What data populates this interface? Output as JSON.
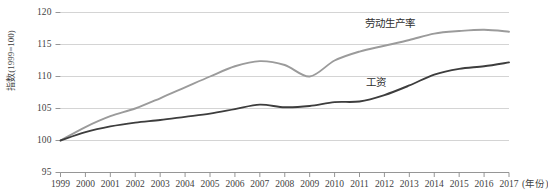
{
  "chart_data": {
    "type": "line",
    "title": "",
    "subtitle": "",
    "xlabel": "(年份)",
    "ylabel": "指数(1999=100)",
    "xlim": [
      1999,
      2017
    ],
    "ylim": [
      95,
      120
    ],
    "yticks": [
      95,
      100,
      105,
      110,
      115,
      120
    ],
    "grid": true,
    "grid_axis": "y",
    "legend_position": "inline-annotation",
    "x": [
      1999,
      2000,
      2001,
      2002,
      2003,
      2004,
      2005,
      2006,
      2007,
      2008,
      2009,
      2010,
      2011,
      2012,
      2013,
      2014,
      2015,
      2016,
      2017
    ],
    "xticklabels": [
      "1999",
      "2000",
      "2001",
      "2002",
      "2003",
      "2004",
      "2005",
      "2006",
      "2007",
      "2008",
      "2009",
      "2010",
      "2011",
      "2012",
      "2013",
      "2014",
      "2015",
      "2016",
      "2017"
    ],
    "series": [
      {
        "name": "劳动生产率",
        "color": "#9b9b9b",
        "values": [
          100.0,
          102.1,
          103.8,
          105.0,
          106.6,
          108.3,
          110.0,
          111.6,
          112.4,
          111.8,
          110.0,
          112.5,
          113.9,
          114.8,
          115.7,
          116.7,
          117.1,
          117.3,
          117.0
        ]
      },
      {
        "name": "工资",
        "color": "#3d3d3d",
        "values": [
          100.0,
          101.3,
          102.2,
          102.8,
          103.2,
          103.7,
          104.2,
          104.9,
          105.6,
          105.2,
          105.4,
          106.0,
          106.1,
          107.1,
          108.6,
          110.3,
          111.2,
          111.6,
          112.2
        ]
      }
    ],
    "annotations": [
      {
        "text": "劳动生产率",
        "near_series": "劳动生产率",
        "x": 2013
      },
      {
        "text": "工资",
        "near_series": "工资",
        "x": 2013
      }
    ]
  },
  "axis": {
    "y_tick_labels": [
      "120",
      "115",
      "110",
      "105",
      "100",
      "95"
    ],
    "y_axis_title": "指数(1999=100)",
    "x_unit_label": "(年份)"
  }
}
